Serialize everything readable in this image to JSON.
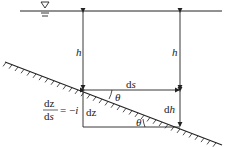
{
  "diagram": {
    "type": "open-channel flow slope element",
    "labels": {
      "h_left": "h",
      "h_right": "h",
      "ds": "ds",
      "ds_d": "d",
      "ds_s": "s",
      "theta_top": "θ",
      "theta_bottom": "θ",
      "dh_d": "d",
      "dh_h": "h",
      "dz": "dz",
      "eq_num": "dz",
      "eq_den_d": "d",
      "eq_den_s": "s",
      "eq_rhs": "= −",
      "eq_i": "i"
    },
    "symbols": [
      "water-surface-triangle",
      "bed-hatching"
    ],
    "colors": {
      "line": "#222222",
      "background": "#ffffff"
    }
  }
}
